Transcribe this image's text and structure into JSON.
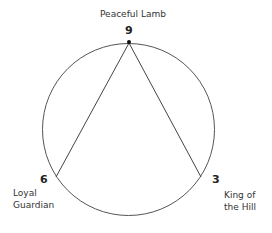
{
  "diagram": {
    "type": "enneagram-triad",
    "circle": {
      "cx": 128.5,
      "cy": 129.5,
      "r": 86,
      "stroke": "#555555"
    },
    "points": [
      {
        "id": "9",
        "number": "9",
        "name": "Peaceful Lamb",
        "x": 129,
        "y": 43
      },
      {
        "id": "6",
        "number": "6",
        "name_line1": "Loyal",
        "name_line2": "Guardian",
        "x": 56,
        "y": 177
      },
      {
        "id": "3",
        "number": "3",
        "name_line1": "King of",
        "name_line2": "the Hill",
        "x": 201,
        "y": 177
      }
    ],
    "connections": [
      {
        "from": "9",
        "to": "6"
      },
      {
        "from": "9",
        "to": "3"
      }
    ],
    "line_color": "#444444",
    "dot_color": "#111111"
  }
}
